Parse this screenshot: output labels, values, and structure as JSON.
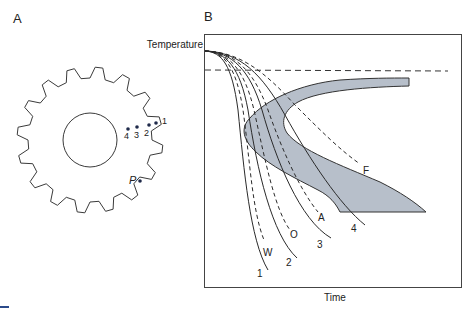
{
  "panel_a": {
    "label": "A",
    "gear": {
      "teeth": 16,
      "hole": true
    },
    "points": [
      {
        "id": "1",
        "label": "1"
      },
      {
        "id": "2",
        "label": "2"
      },
      {
        "id": "3",
        "label": "3"
      },
      {
        "id": "4",
        "label": "4"
      },
      {
        "id": "P",
        "label": "P"
      }
    ]
  },
  "panel_b": {
    "label": "B",
    "y_label": "Temperature",
    "x_label": "Time",
    "curve_labels": {
      "c1": "1",
      "c2": "2",
      "c3": "3",
      "c4": "4",
      "W": "W",
      "O": "O",
      "A": "A",
      "F": "F"
    }
  },
  "colors": {
    "line": "#2a2a2a",
    "band_fill": "#b7bfca",
    "accent": "#2b4a8a"
  },
  "chart_data": {
    "type": "line",
    "title": "",
    "xlabel": "Time",
    "ylabel": "Temperature",
    "grid": false,
    "series": [
      {
        "name": "1",
        "style": "solid",
        "note": "cooling curve at point 1 (surface)"
      },
      {
        "name": "W",
        "style": "dashed",
        "note": "water quench"
      },
      {
        "name": "2",
        "style": "solid",
        "note": "cooling curve at point 2"
      },
      {
        "name": "O",
        "style": "dashed",
        "note": "oil quench"
      },
      {
        "name": "3",
        "style": "solid",
        "note": "cooling curve at point 3"
      },
      {
        "name": "A",
        "style": "dashed",
        "note": "air cool"
      },
      {
        "name": "4",
        "style": "solid",
        "note": "cooling curve at point 4 (interior)"
      },
      {
        "name": "F",
        "style": "dashed",
        "note": "furnace cool"
      }
    ],
    "annotations": [
      {
        "type": "horizontal_dashed_line",
        "meaning": "critical temperature"
      },
      {
        "type": "shaded_band",
        "meaning": "C-shaped transformation region"
      }
    ]
  }
}
